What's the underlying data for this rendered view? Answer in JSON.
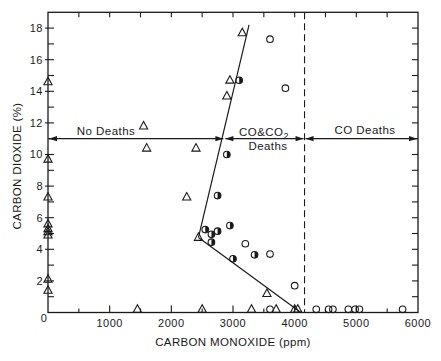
{
  "chart_data": {
    "type": "scatter",
    "title": "",
    "xlabel": "CARBON MONOXIDE (ppm)",
    "ylabel": "CARBON DIOXIDE (%)",
    "xlim": [
      0,
      6000
    ],
    "ylim": [
      0,
      19
    ],
    "x_ticks": [
      1000,
      2000,
      3000,
      4000,
      5000,
      6000
    ],
    "x_minor_step": 500,
    "y_ticks": [
      2,
      4,
      6,
      8,
      10,
      12,
      14,
      16,
      18
    ],
    "y_minor_step": 1,
    "origin_label": "0",
    "grid": false,
    "legend": null,
    "series": [
      {
        "name": "open triangles",
        "marker": "open-triangle",
        "points": [
          [
            0,
            14.6
          ],
          [
            0,
            9.7
          ],
          [
            0,
            7.3
          ],
          [
            0,
            5.6
          ],
          [
            0,
            5.3
          ],
          [
            0,
            5.1
          ],
          [
            0,
            4.9
          ],
          [
            0,
            2.1
          ],
          [
            0,
            1.4
          ],
          [
            1550,
            11.8
          ],
          [
            1600,
            10.4
          ],
          [
            2400,
            10.4
          ],
          [
            2250,
            7.3
          ],
          [
            2440,
            4.75
          ],
          [
            3150,
            17.7
          ],
          [
            2950,
            14.7
          ],
          [
            2900,
            13.7
          ],
          [
            3550,
            1.2
          ],
          [
            1450,
            0.2
          ],
          [
            2500,
            0.2
          ],
          [
            3300,
            0.2
          ],
          [
            3700,
            0.2
          ],
          [
            4000,
            0.2
          ],
          [
            4050,
            0.2
          ]
        ]
      },
      {
        "name": "half-filled circles",
        "marker": "half-filled-circle",
        "points": [
          [
            3100,
            14.7
          ],
          [
            2900,
            10.0
          ],
          [
            2750,
            7.4
          ],
          [
            2550,
            5.25
          ],
          [
            2650,
            4.95
          ],
          [
            2750,
            5.15
          ],
          [
            2950,
            5.5
          ],
          [
            2650,
            4.45
          ],
          [
            3000,
            3.4
          ],
          [
            3350,
            3.65
          ]
        ]
      },
      {
        "name": "open circles",
        "marker": "open-circle",
        "points": [
          [
            3600,
            17.3
          ],
          [
            3850,
            14.2
          ],
          [
            3200,
            4.35
          ],
          [
            3600,
            3.7
          ],
          [
            4000,
            1.7
          ],
          [
            3600,
            0.2
          ],
          [
            4350,
            0.2
          ],
          [
            4550,
            0.2
          ],
          [
            4620,
            0.2
          ],
          [
            4870,
            0.2
          ],
          [
            4980,
            0.2
          ],
          [
            5050,
            0.2
          ],
          [
            5750,
            0.2
          ]
        ]
      }
    ],
    "fit_lines": [
      {
        "from": [
          2440,
          4.75
        ],
        "to": [
          3260,
          18.2
        ]
      },
      {
        "from": [
          2440,
          4.75
        ],
        "to": [
          4100,
          0
        ]
      }
    ],
    "reference_lines": [
      {
        "orientation": "vertical",
        "x": 4160,
        "style": "dashed"
      }
    ],
    "regions": [
      {
        "label": "No Deaths",
        "x_range": [
          0,
          2860
        ],
        "arrow_y": 11
      },
      {
        "label": "CO&CO",
        "label_sub": "2",
        "label_line2": "Deaths",
        "x_range": [
          2860,
          4160
        ],
        "arrow_y": 11
      },
      {
        "label": "CO Deaths",
        "x_range": [
          4160,
          6000
        ],
        "arrow_y": 11
      }
    ]
  }
}
